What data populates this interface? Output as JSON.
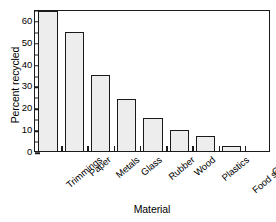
{
  "chart_data": {
    "type": "bar",
    "title": "",
    "xlabel": "Material",
    "ylabel": "Percent recycled",
    "categories": [
      "Trimmings",
      "Paper",
      "Metals",
      "Glass",
      "Rubber",
      "Wood",
      "Plastics",
      "Food scraps",
      "Other"
    ],
    "values": [
      64,
      54.5,
      35,
      24,
      15,
      9.5,
      7,
      2.5,
      0
    ],
    "ylim": [
      0,
      65
    ],
    "xlim_note": "categorical, 9 equal slots",
    "y_major_ticks": [
      0,
      10,
      20,
      30,
      40,
      50,
      60
    ],
    "y_tick_labels": [
      "0",
      "10",
      "20",
      "30",
      "40",
      "50",
      "60"
    ],
    "y_minor_ticks": [
      5,
      15,
      25,
      35,
      45,
      55,
      65
    ],
    "grid": false,
    "legend": null,
    "legend_position": "none",
    "bar_fill_color": "#ededed",
    "bar_edge_color": "#1a1a1a",
    "background_color": "#ffffff",
    "frame": "full-box",
    "x_tick_label_rotation": -40
  }
}
